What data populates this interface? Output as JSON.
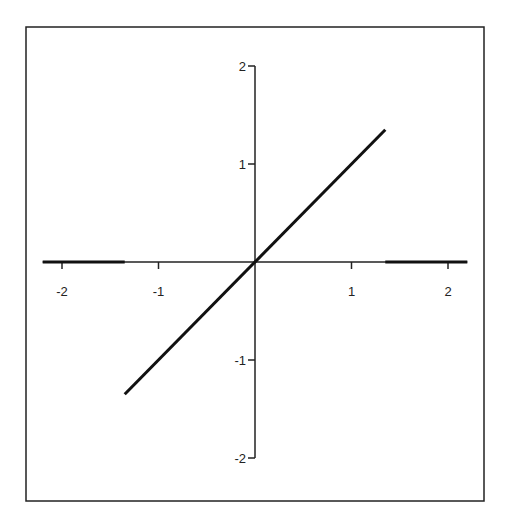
{
  "chart_data": {
    "type": "line",
    "title": "",
    "xlabel": "",
    "ylabel": "",
    "xlim": [
      -2.2,
      2.2
    ],
    "ylim": [
      -2,
      2
    ],
    "grid": false,
    "legend": null,
    "x_ticks": [
      -2,
      -1,
      1,
      2
    ],
    "x_tick_labels": [
      "-2",
      "-1",
      "1",
      "2"
    ],
    "y_ticks": [
      2,
      1,
      -1,
      -2
    ],
    "y_tick_labels": [
      "2",
      "1",
      "-1",
      "-2"
    ],
    "series": [
      {
        "name": "function",
        "description": "y = x for |x| <= 1.35, y = 0 otherwise",
        "segments": [
          {
            "x": [
              -2.2,
              -1.35
            ],
            "y": [
              0,
              0
            ]
          },
          {
            "x": [
              -1.35,
              1.35
            ],
            "y": [
              -1.35,
              1.35
            ]
          },
          {
            "x": [
              1.35,
              2.2
            ],
            "y": [
              0,
              0
            ]
          }
        ]
      }
    ],
    "colors": {
      "line": "#111111",
      "axis": "#222222",
      "frame": "#222222",
      "background": "#ffffff"
    }
  }
}
